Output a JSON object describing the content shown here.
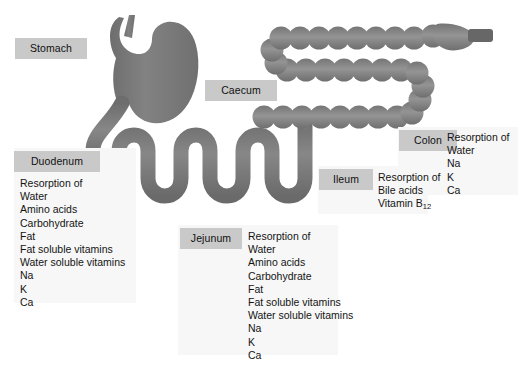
{
  "figure": {
    "background_color": "#ffffff",
    "organ_color": "#787878",
    "organ_color_light": "#8d8d8d",
    "chip_color": "#c9c9c9",
    "panel_color": "#f7f7f7",
    "text_color": "#141414"
  },
  "labels": {
    "stomach": "Stomach",
    "caecum": "Caecum",
    "colon": "Colon",
    "duodenum": "Duodenum",
    "jejunum": "Jejunum",
    "ileum": "Ileum"
  },
  "lists": {
    "duodenum": {
      "heading": "Resorption of",
      "items": [
        "Water",
        "Amino acids",
        "Carbohydrate",
        "Fat",
        "Fat soluble vitamins",
        "Water soluble vitamins",
        "Na",
        "K",
        "Ca"
      ]
    },
    "jejunum": {
      "heading": "Resorption of",
      "items": [
        "Water",
        "Amino acids",
        "Carbohydrate",
        "Fat",
        "Fat soluble vitamins",
        "Water soluble vitamins",
        "Na",
        "K",
        "Ca"
      ]
    },
    "ileum": {
      "heading": "Resorption of",
      "items": [
        "Bile acids"
      ],
      "vitamin_label": "Vitamin B",
      "vitamin_subscript": "12"
    },
    "colon": {
      "heading": "Resorption of",
      "items": [
        "Water",
        "Na",
        "K",
        "Ca"
      ]
    }
  },
  "anatomy": {
    "parts": [
      "oesophagus",
      "stomach",
      "duodenum",
      "jejunum",
      "ileum",
      "caecum",
      "appendix",
      "ascending-colon",
      "transverse-colon",
      "descending-colon",
      "rectum",
      "anal-canal"
    ]
  }
}
